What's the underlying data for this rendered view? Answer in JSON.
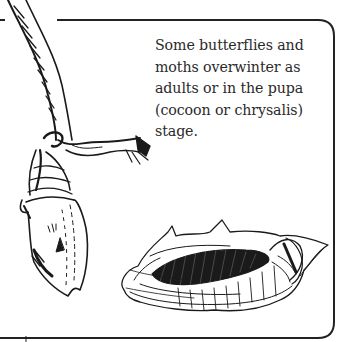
{
  "caption": {
    "lines": [
      "Some butterflies and",
      "moths overwinter as",
      "adults or in the pupa",
      "(cocoon or chrysalis)",
      "stage."
    ]
  },
  "illustrations": {
    "chrysalis": "chrysalis-hanging-from-twig",
    "cocoon": "silk-cocoon"
  },
  "colors": {
    "ink": "#1a1a1a",
    "border": "#222222",
    "background": "#ffffff"
  }
}
